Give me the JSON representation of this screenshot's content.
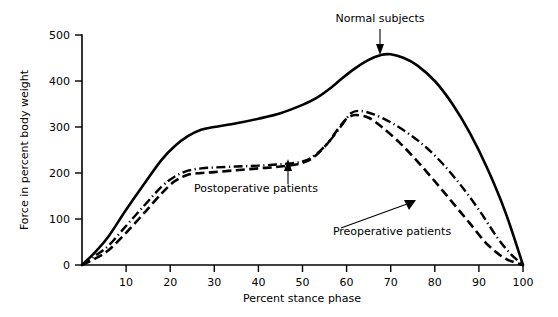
{
  "chart_data": {
    "type": "line",
    "title": "",
    "xlabel": "Percent stance phase",
    "ylabel": "Force in percent body weight",
    "xlim": [
      0,
      100
    ],
    "ylim": [
      0,
      500
    ],
    "xticks": [
      10,
      20,
      30,
      40,
      50,
      60,
      70,
      80,
      90,
      100
    ],
    "xtick_labels": [
      "10",
      "20",
      "30",
      "40",
      "50",
      "60",
      "70",
      "80",
      "90",
      "100"
    ],
    "yticks": [
      0,
      100,
      200,
      300,
      400,
      500
    ],
    "ytick_labels": [
      "0",
      "100",
      "200",
      "300",
      "400",
      "500"
    ],
    "grid": false,
    "legend_position": "inline-annotations",
    "series": [
      {
        "name": "Normal subjects",
        "style": "solid",
        "x": [
          0,
          3,
          6,
          10,
          14,
          18,
          21,
          24,
          27,
          30,
          35,
          40,
          45,
          50,
          53,
          56,
          59,
          62,
          65,
          68,
          70,
          73,
          76,
          80,
          84,
          88,
          92,
          96,
          100
        ],
        "y": [
          0,
          28,
          62,
          120,
          175,
          228,
          258,
          280,
          294,
          300,
          308,
          318,
          330,
          348,
          362,
          382,
          406,
          428,
          446,
          457,
          458,
          450,
          434,
          400,
          350,
          286,
          208,
          115,
          0
        ]
      },
      {
        "name": "Postoperative patients",
        "style": "dash-dot",
        "x": [
          0,
          3,
          6,
          10,
          14,
          18,
          21,
          24,
          27,
          30,
          35,
          40,
          45,
          50,
          53,
          56,
          59,
          61,
          63,
          66,
          70,
          74,
          78,
          82,
          86,
          90,
          94,
          97,
          100
        ],
        "y": [
          0,
          20,
          42,
          85,
          128,
          170,
          192,
          205,
          210,
          212,
          214,
          216,
          219,
          225,
          240,
          268,
          305,
          330,
          335,
          328,
          310,
          286,
          256,
          218,
          172,
          120,
          62,
          26,
          0
        ]
      },
      {
        "name": "Preoperative patients",
        "style": "dashed",
        "x": [
          0,
          3,
          6,
          10,
          14,
          18,
          21,
          24,
          27,
          30,
          35,
          40,
          45,
          50,
          53,
          56,
          58,
          60,
          62,
          65,
          68,
          72,
          76,
          80,
          84,
          88,
          92,
          96,
          100
        ],
        "y": [
          0,
          14,
          32,
          70,
          112,
          155,
          182,
          196,
          200,
          202,
          206,
          210,
          214,
          222,
          238,
          268,
          295,
          318,
          326,
          320,
          300,
          266,
          226,
          182,
          136,
          90,
          44,
          14,
          0
        ]
      }
    ],
    "annotations": [
      {
        "text": "Normal subjects",
        "points_to_series": "Normal subjects",
        "target_x": 69,
        "target_y": 458
      },
      {
        "text": "Postoperative patients",
        "points_to_series": "Postoperative patients",
        "target_x": 47,
        "target_y": 218
      },
      {
        "text": "Preoperative patients",
        "points_to_series": "Preoperative patients",
        "target_x": 76,
        "target_y": 152
      }
    ],
    "colors": {
      "axis": "#000000",
      "series": "#000000",
      "background": "#ffffff"
    }
  }
}
